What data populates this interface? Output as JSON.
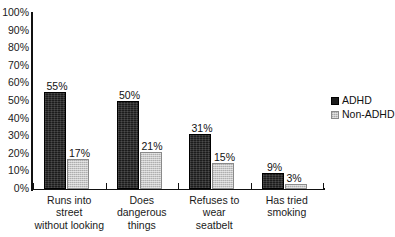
{
  "chart_data": {
    "type": "bar",
    "title": "",
    "xlabel": "",
    "ylabel": "",
    "ylim": [
      0,
      100
    ],
    "grid": true,
    "legend_position": "right",
    "y_ticks": [
      "0%",
      "10%",
      "20%",
      "30%",
      "40%",
      "50%",
      "60%",
      "70%",
      "80%",
      "90%",
      "100%"
    ],
    "categories": [
      "Runs into street without looking",
      "Does dangerous things",
      "Refuses to wear seatbelt",
      "Has tried smoking"
    ],
    "category_lines": [
      [
        "Runs into street",
        "without looking"
      ],
      [
        "Does",
        "dangerous",
        "things"
      ],
      [
        "Refuses to wear",
        "seatbelt"
      ],
      [
        "Has tried",
        "smoking"
      ]
    ],
    "series": [
      {
        "name": "ADHD",
        "color": "#1c1c1c",
        "values": [
          55,
          50,
          31,
          9
        ],
        "labels": [
          "55%",
          "50%",
          "31%",
          "9%"
        ]
      },
      {
        "name": "Non-ADHD",
        "color": "#c6c6c6",
        "values": [
          17,
          21,
          15,
          3
        ],
        "labels": [
          "17%",
          "21%",
          "15%",
          "3%"
        ]
      }
    ]
  },
  "legend": {
    "items": [
      {
        "label": "ADHD",
        "swatch": "black-square-swatch"
      },
      {
        "label": "Non-ADHD",
        "swatch": "gray-square-swatch"
      }
    ]
  }
}
